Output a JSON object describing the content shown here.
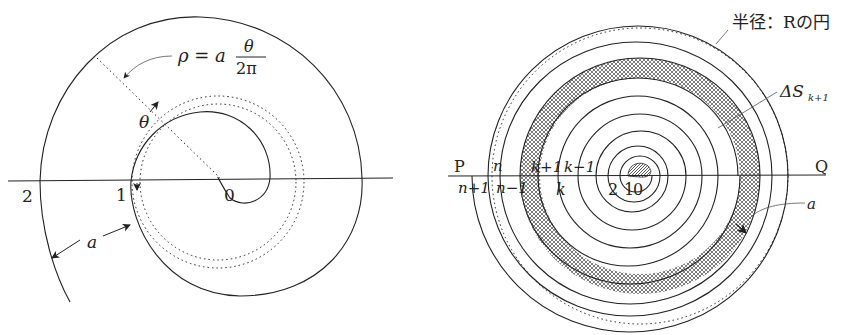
{
  "left_figure": {
    "formula": {
      "lhs": "ρ = a",
      "numerator": "θ",
      "denominator": "2π"
    },
    "angle_label": "θ",
    "axis_labels": {
      "origin": "0",
      "turn1": "1",
      "turn2": "2"
    },
    "spacing_label": "a"
  },
  "right_figure": {
    "circle_label": "半径：Rの円",
    "area_label": {
      "main": "ΔS",
      "sub": "k+1"
    },
    "endpoints": {
      "left": "P",
      "right": "Q"
    },
    "upper_labels": {
      "n": "n",
      "k_plus_1": "k+1",
      "k_minus_1": "k−1"
    },
    "lower_labels": {
      "n_plus_1": "n+1",
      "n_minus_1": "n−1",
      "k": "k",
      "two": "2",
      "one": "1",
      "zero": "0"
    },
    "spacing_label": "a"
  },
  "colors": {
    "line": "#222222",
    "hatch": "#555555",
    "background": "#ffffff"
  }
}
